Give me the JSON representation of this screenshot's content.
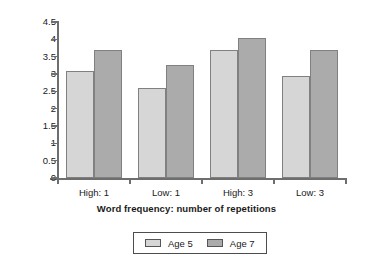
{
  "chart_data": {
    "type": "bar",
    "title": "",
    "xlabel": "Word frequency: number of repetitions",
    "ylabel": "Mean memory span",
    "categories": [
      "High: 1",
      "Low: 1",
      "High: 3",
      "Low: 3"
    ],
    "series": [
      {
        "name": "Age 5",
        "color": "#d6d6d6",
        "values": [
          3.1,
          2.6,
          3.7,
          2.95
        ]
      },
      {
        "name": "Age 7",
        "color": "#ababab",
        "values": [
          3.7,
          3.25,
          4.05,
          3.7
        ]
      }
    ],
    "ylim": [
      0,
      4.5
    ],
    "yticks": [
      "0",
      "0.5",
      "1",
      "1.5",
      "2",
      "2.5",
      "3",
      "3.5",
      "4",
      "4.5"
    ],
    "ytick_values": [
      0,
      0.5,
      1,
      1.5,
      2,
      2.5,
      3,
      3.5,
      4,
      4.5
    ],
    "grid": false,
    "legend_position": "bottom",
    "legend_entries": [
      "Age 5",
      "Age 7"
    ]
  }
}
